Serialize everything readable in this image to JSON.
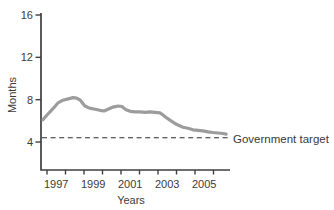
{
  "chart_data": {
    "type": "line",
    "title": "",
    "xlabel": "Years",
    "ylabel": "Months",
    "xlim": [
      1996.7,
      2006.9
    ],
    "ylim": [
      1.4,
      16.2
    ],
    "yticks": [
      4,
      8,
      12,
      16
    ],
    "xticks": [
      1997,
      1998,
      1999,
      2000,
      2001,
      2002,
      2003,
      2004,
      2005,
      2006
    ],
    "xtick_labeled_years": [
      1997,
      1999,
      2001,
      2003,
      2005
    ],
    "grid": false,
    "legend": "none",
    "series": [
      {
        "name": "waiting-time-months",
        "color": "#9c9c9c",
        "x": [
          1996.78,
          1997.0,
          1997.3,
          1997.6,
          1997.86,
          1998.1,
          1998.4,
          1998.6,
          1998.8,
          1999.05,
          1999.3,
          1999.6,
          1999.86,
          2000.08,
          2000.3,
          2000.57,
          2000.84,
          2001.05,
          2001.27,
          2001.5,
          2001.76,
          2002.03,
          2002.3,
          2002.57,
          2002.84,
          2003.11,
          2003.27,
          2003.49,
          2003.7,
          2003.92,
          2004.14,
          2004.35,
          2004.62,
          2004.89,
          2005.16,
          2005.43,
          2005.7,
          2005.97,
          2006.24,
          2006.51,
          2006.68
        ],
        "y": [
          6.1,
          6.55,
          7.1,
          7.7,
          7.95,
          8.05,
          8.2,
          8.15,
          7.95,
          7.4,
          7.2,
          7.1,
          7.0,
          6.93,
          7.1,
          7.3,
          7.4,
          7.35,
          7.05,
          6.9,
          6.85,
          6.85,
          6.8,
          6.85,
          6.8,
          6.75,
          6.55,
          6.25,
          6.0,
          5.75,
          5.55,
          5.4,
          5.3,
          5.15,
          5.1,
          5.05,
          4.95,
          4.9,
          4.85,
          4.8,
          4.75
        ]
      }
    ],
    "reference_line": {
      "value": 4.4,
      "style": "dashed",
      "color": "#2e2e2e",
      "label": "Government target"
    }
  },
  "colors": {
    "axis": "#3f3f3f",
    "text": "#3b3b3b",
    "line": "#9c9c9c",
    "background": "#ffffff"
  }
}
